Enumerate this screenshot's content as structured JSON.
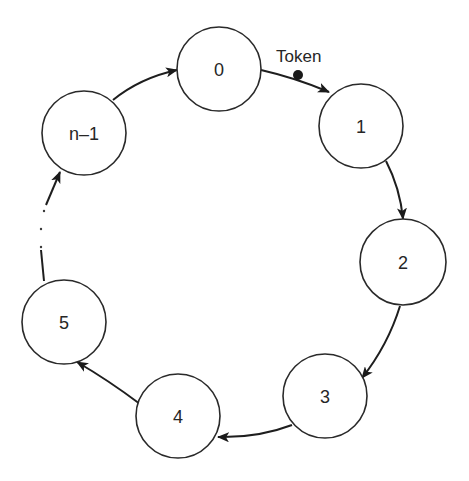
{
  "diagram": {
    "nodes": [
      {
        "id": "0",
        "label": "0"
      },
      {
        "id": "1",
        "label": "1"
      },
      {
        "id": "2",
        "label": "2"
      },
      {
        "id": "3",
        "label": "3"
      },
      {
        "id": "4",
        "label": "4"
      },
      {
        "id": "5",
        "label": "5"
      },
      {
        "id": "n-1",
        "label": "n–1"
      }
    ],
    "edges": [
      {
        "from": "0",
        "to": "1",
        "label": "Token"
      },
      {
        "from": "1",
        "to": "2"
      },
      {
        "from": "2",
        "to": "3"
      },
      {
        "from": "3",
        "to": "4"
      },
      {
        "from": "4",
        "to": "5"
      },
      {
        "from": "5",
        "to": "n-1",
        "style": "elided (dotted gap)"
      },
      {
        "from": "n-1",
        "to": "0"
      }
    ],
    "token": {
      "label": "Token",
      "position": "on edge 0→1"
    },
    "colors": {
      "stroke": "#2a2a2a",
      "background": "#ffffff"
    }
  }
}
